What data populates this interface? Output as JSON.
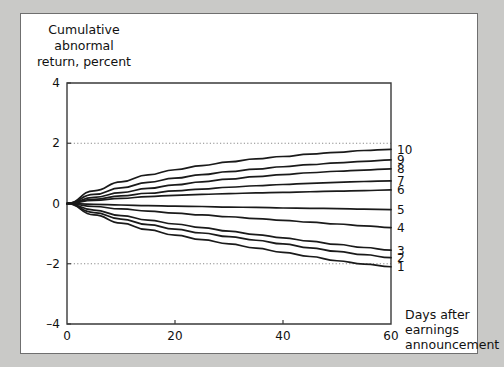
{
  "chart_data": {
    "type": "line",
    "title": "",
    "ylabel": "Cumulative abnormal return, percent",
    "xlabel": "Days after earnings announcement",
    "xlim": [
      0,
      60
    ],
    "ylim": [
      -4,
      4
    ],
    "xticks": [
      0,
      20,
      40,
      60
    ],
    "xticklabels": [
      "0",
      "20",
      "40",
      "60"
    ],
    "yticks": [
      4,
      2,
      0,
      -2,
      -4
    ],
    "yticklabels": [
      "4",
      "2",
      "0",
      "-2",
      "-4"
    ],
    "gridlines_y": [
      2,
      -2
    ],
    "grid": "dotted horizontal at y=2 and y=-2",
    "legend_position": "right-end-of-line",
    "x": [
      0,
      5,
      10,
      15,
      20,
      25,
      30,
      35,
      40,
      45,
      50,
      55,
      60
    ],
    "series": [
      {
        "name": "10",
        "label": "10",
        "values": [
          0,
          0.42,
          0.72,
          0.95,
          1.12,
          1.26,
          1.38,
          1.48,
          1.56,
          1.64,
          1.7,
          1.76,
          1.8
        ]
      },
      {
        "name": "9",
        "label": "9",
        "values": [
          0,
          0.3,
          0.52,
          0.7,
          0.84,
          0.96,
          1.06,
          1.14,
          1.22,
          1.29,
          1.35,
          1.4,
          1.45
        ]
      },
      {
        "name": "8",
        "label": "8",
        "values": [
          0,
          0.2,
          0.36,
          0.5,
          0.62,
          0.72,
          0.81,
          0.89,
          0.96,
          1.02,
          1.07,
          1.11,
          1.15
        ]
      },
      {
        "name": "7",
        "label": "7",
        "values": [
          0,
          0.14,
          0.25,
          0.34,
          0.42,
          0.48,
          0.54,
          0.59,
          0.63,
          0.67,
          0.7,
          0.73,
          0.75
        ]
      },
      {
        "name": "6",
        "label": "6",
        "values": [
          0,
          0.1,
          0.17,
          0.23,
          0.27,
          0.3,
          0.33,
          0.35,
          0.37,
          0.39,
          0.41,
          0.43,
          0.45
        ]
      },
      {
        "name": "5",
        "label": "5",
        "values": [
          0,
          -0.03,
          -0.05,
          -0.07,
          -0.09,
          -0.1,
          -0.12,
          -0.13,
          -0.15,
          -0.16,
          -0.17,
          -0.19,
          -0.2
        ]
      },
      {
        "name": "4",
        "label": "4",
        "values": [
          0,
          -0.1,
          -0.18,
          -0.25,
          -0.32,
          -0.38,
          -0.44,
          -0.5,
          -0.56,
          -0.62,
          -0.68,
          -0.74,
          -0.8
        ]
      },
      {
        "name": "3",
        "label": "3",
        "values": [
          0,
          -0.22,
          -0.4,
          -0.55,
          -0.68,
          -0.8,
          -0.92,
          -1.03,
          -1.14,
          -1.25,
          -1.36,
          -1.46,
          -1.55
        ]
      },
      {
        "name": "2",
        "label": "2",
        "values": [
          0,
          -0.3,
          -0.52,
          -0.7,
          -0.85,
          -0.98,
          -1.1,
          -1.22,
          -1.34,
          -1.47,
          -1.59,
          -1.7,
          -1.8
        ]
      },
      {
        "name": "1",
        "label": "1",
        "values": [
          0,
          -0.38,
          -0.65,
          -0.87,
          -1.05,
          -1.2,
          -1.34,
          -1.48,
          -1.62,
          -1.76,
          -1.9,
          -2.01,
          -2.1
        ]
      }
    ]
  },
  "axis": {
    "y_caption_line1": "Cumulative",
    "y_caption_line2": "abnormal",
    "y_caption_line3": "return, percent",
    "x_caption_line1": "Days after",
    "x_caption_line2": "earnings",
    "x_caption_line3": "announcement"
  },
  "colors": {
    "line": "#1a1a1a",
    "axis": "#3a3a3a",
    "grid": "#8a8a8a",
    "page_background": "#c9c9c7",
    "figure_background": "#ffffff",
    "figure_border": "#6f6f6f"
  }
}
